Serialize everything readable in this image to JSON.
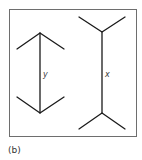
{
  "figure": {
    "caption": "(b)",
    "illusion": "Müller-Lyer",
    "colors": {
      "frame": "#6e6e6e",
      "lines": "#1a1a1a",
      "background": "#ffffff"
    },
    "left_figure": {
      "label": "y",
      "description": "vertical shaft with inward-pointing arrowheads (fins converge at ends)"
    },
    "right_figure": {
      "label": "x",
      "description": "vertical shaft with outward-pointing fins (fins diverge at ends)"
    }
  }
}
